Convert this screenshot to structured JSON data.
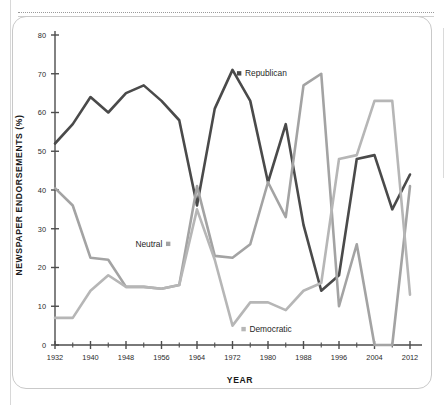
{
  "page": {
    "background_color": "#ffffff",
    "card_border_color": "#c9c9c9"
  },
  "chart_data": {
    "type": "line",
    "title": "",
    "xlabel": "YEAR",
    "ylabel": "NEWSPAPER ENDORSEMENTS (%)",
    "xlim": [
      1932,
      2012
    ],
    "ylim": [
      0,
      80
    ],
    "grid": false,
    "legend_position": "inline-annotations",
    "x_tick_labels": [
      "1932",
      "1940",
      "1948",
      "1956",
      "1964",
      "1972",
      "1980",
      "1988",
      "1996",
      "2004",
      "2012"
    ],
    "x_tick_values": [
      1932,
      1940,
      1948,
      1956,
      1964,
      1972,
      1980,
      1988,
      1996,
      2004,
      2012
    ],
    "x_minor_tick_values": [
      1936,
      1944,
      1952,
      1960,
      1968,
      1976,
      1984,
      1992,
      2000,
      2008
    ],
    "y_tick_labels": [
      "0",
      "10",
      "20",
      "30",
      "40",
      "50",
      "60",
      "70",
      "80"
    ],
    "y_tick_values": [
      0,
      10,
      20,
      30,
      40,
      50,
      60,
      70,
      80
    ],
    "x": [
      1932,
      1936,
      1940,
      1944,
      1948,
      1952,
      1956,
      1960,
      1964,
      1968,
      1972,
      1976,
      1980,
      1984,
      1988,
      1992,
      1996,
      2000,
      2004,
      2008,
      2012
    ],
    "series": [
      {
        "name": "Republican",
        "color": "#4a4a4a",
        "values": [
          52,
          57,
          64,
          60,
          65,
          67,
          63,
          58,
          36,
          61,
          71,
          63,
          42,
          57,
          31,
          14,
          18,
          48,
          49,
          35,
          44
        ]
      },
      {
        "name": "Neutral",
        "color": "#a3a3a3",
        "values": [
          40.5,
          36,
          22.5,
          22,
          15,
          15,
          14.5,
          15.5,
          41,
          23,
          22.5,
          26,
          42,
          33,
          67,
          70,
          10,
          26,
          0,
          0,
          41
        ]
      },
      {
        "name": "Democratic",
        "color": "#b6b6b6",
        "values": [
          7,
          7,
          14,
          18,
          15,
          15,
          14.5,
          15.5,
          35,
          22,
          5,
          11,
          11,
          9,
          14,
          16,
          48,
          49,
          63,
          63,
          13
        ]
      }
    ],
    "annotations": [
      {
        "label": "Republican",
        "marker_color": "#4a4a4a",
        "at_x": 1973,
        "at_y": 70,
        "align": "right"
      },
      {
        "label": "Neutral",
        "marker_color": "#a3a3a3",
        "at_x": 1958,
        "at_y": 26,
        "align": "left"
      },
      {
        "label": "Democratic",
        "marker_color": "#b6b6b6",
        "at_x": 1974,
        "at_y": 4,
        "align": "right"
      }
    ]
  }
}
